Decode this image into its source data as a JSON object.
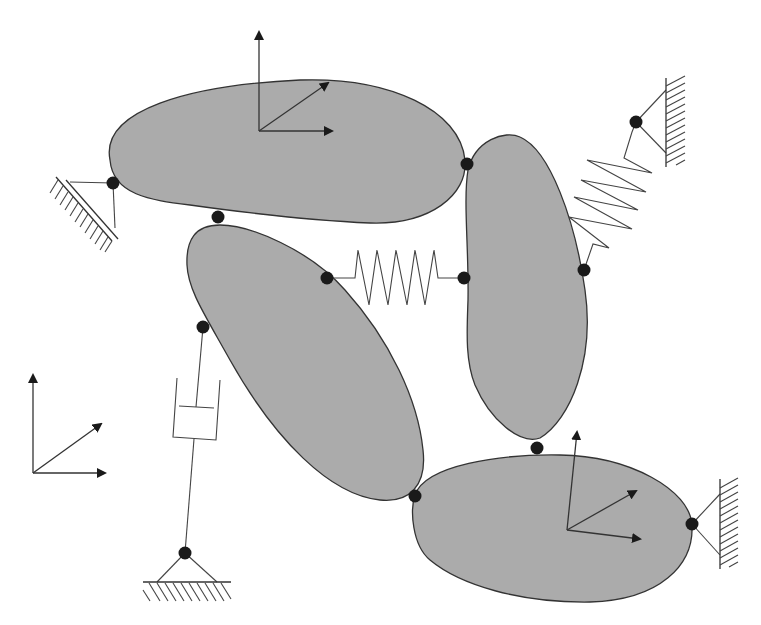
{
  "diagram": {
    "type": "multibody-system",
    "colors": {
      "background": "#ffffff",
      "body_fill": "#ababab",
      "outline": "#333333",
      "joint": "#1a1a1a"
    },
    "bodies": [
      {
        "id": "body-1",
        "label": "upper-horizontal-body",
        "path": "M110,160 C100,110 190,85 300,80 C390,77 460,110 465,160 C468,195 430,225 370,223 C300,220 240,212 190,205 C150,200 113,195 110,160 Z",
        "frame": {
          "origin": [
            259,
            131
          ],
          "axes": [
            [
              259,
              30
            ],
            [
              334,
              131
            ],
            [
              330,
              82
            ]
          ]
        }
      },
      {
        "id": "body-2",
        "label": "diagonal-left-body",
        "path": "M220,225 C250,225 310,250 345,290 C390,340 418,400 423,450 C427,485 410,503 380,500 C330,495 275,440 230,360 C205,315 188,290 187,265 C186,240 195,225 220,225 Z",
        "frame": null
      },
      {
        "id": "body-3",
        "label": "vertical-right-body",
        "path": "M468,170 C475,140 505,130 520,137 C550,150 575,220 585,290 C595,360 570,420 540,438 C520,445 490,420 475,385 C465,360 467,330 468,300 C469,250 463,200 468,170 Z",
        "frame": null
      },
      {
        "id": "body-4",
        "label": "lower-right-body",
        "path": "M415,495 C425,465 500,454 560,455 C630,456 690,490 692,525 C694,565 660,600 590,602 C520,603 460,585 430,560 C412,545 410,510 415,495 Z",
        "frame": {
          "origin": [
            567,
            530
          ],
          "axes": [
            [
              577,
              430
            ],
            [
              642,
              540
            ],
            [
              638,
              490
            ]
          ]
        }
      }
    ],
    "joints": [
      {
        "id": "j-ground-left",
        "pos": [
          113,
          183
        ]
      },
      {
        "id": "j-body1-body2",
        "pos": [
          218,
          217
        ]
      },
      {
        "id": "j-body1-body3",
        "pos": [
          467,
          164
        ]
      },
      {
        "id": "j-spring-left",
        "pos": [
          327,
          278
        ]
      },
      {
        "id": "j-spring-right",
        "pos": [
          464,
          278
        ]
      },
      {
        "id": "j-damper-top",
        "pos": [
          203,
          327
        ]
      },
      {
        "id": "j-damper-ground",
        "pos": [
          185,
          553
        ]
      },
      {
        "id": "j-body2-body4",
        "pos": [
          415,
          496
        ]
      },
      {
        "id": "j-body3-body4",
        "pos": [
          537,
          448
        ]
      },
      {
        "id": "j-ground-right-lower",
        "pos": [
          692,
          524
        ]
      },
      {
        "id": "j-spring2-body3",
        "pos": [
          584,
          270
        ]
      },
      {
        "id": "j-ground-right-upper",
        "pos": [
          636,
          122
        ]
      }
    ],
    "springs": [
      {
        "id": "spring-horizontal",
        "from": "j-spring-left",
        "to": "j-spring-right",
        "points": "327,278 355,278 358,250 369,305 377,250 388,305 396,250 407,305 415,250 425,305 434,250 438,278 464,278"
      },
      {
        "id": "spring-diagonal",
        "from": "j-spring2-body3",
        "to": "j-ground-right-upper",
        "points": "584,270 593,244 609,248 569,217 632,229 574,197 638,210 581,180 646,192 587,160 652,173 624,158 632,132 636,122"
      }
    ],
    "dampers": [
      {
        "id": "damper-1",
        "from": "j-damper-top",
        "to": "j-damper-ground"
      }
    ],
    "grounds": [
      {
        "id": "ground-left-inclined",
        "attached_to": "j-ground-left"
      },
      {
        "id": "ground-right-upper-wall",
        "attached_to": "j-ground-right-upper"
      },
      {
        "id": "ground-right-lower-wall",
        "attached_to": "j-ground-right-lower"
      },
      {
        "id": "ground-bottom-floor",
        "attached_to": "j-damper-ground"
      }
    ],
    "global_frame": {
      "origin": [
        33,
        473
      ],
      "axes": [
        [
          33,
          373
        ],
        [
          107,
          473
        ],
        [
          103,
          423
        ]
      ]
    }
  }
}
